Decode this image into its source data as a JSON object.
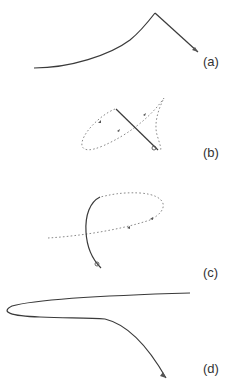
{
  "figure": {
    "panels": [
      {
        "id": "a",
        "label": "(a)",
        "description": "solid curve rising to a peak then straight segment descending to end marker"
      },
      {
        "id": "b",
        "label": "(b)",
        "description": "dotted looping trajectory with arrows crossed by a solid straight segment ending in a small loop marker"
      },
      {
        "id": "c",
        "label": "(c)",
        "description": "dotted elliptical loop trajectory with arrows crossed by a solid curved segment ending in a small loop marker"
      },
      {
        "id": "d",
        "label": "(d)",
        "description": "solid hairpin curve opening to the right, then a curved segment descending to an end marker"
      }
    ],
    "colors": {
      "solid_line": "#3a3a3a",
      "dotted_line": "#8a8a8a",
      "label_text": "#333333",
      "background": "#ffffff"
    }
  }
}
